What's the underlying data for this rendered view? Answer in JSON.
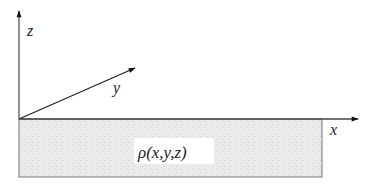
{
  "diagram": {
    "axes": {
      "x": {
        "label": "x"
      },
      "y": {
        "label": "y"
      },
      "z": {
        "label": "z"
      }
    },
    "region": {
      "label": "ρ(x,y,z)",
      "fill": "stippled gray"
    },
    "colors": {
      "axis": "#222222",
      "box_border": "#8a8a8a",
      "stipple_bg": "#ececec"
    }
  }
}
